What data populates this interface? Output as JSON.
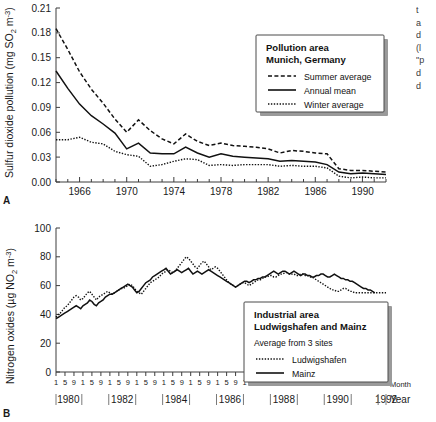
{
  "figure": {
    "panel_a_letter": "A",
    "panel_b_letter": "B"
  },
  "edge_text": {
    "lines": [
      "t",
      "a",
      "d",
      "(l",
      "\"p",
      "d",
      "d"
    ]
  },
  "panel_a": {
    "ylabel": "Sulfur dioxide pollution (mg SO",
    "ylabel_sub": "2",
    "ylabel_tail": " m",
    "ylabel_sup": "-3",
    "ylabel_close": ")",
    "yticks": [
      "0.00",
      "0.03",
      "0.06",
      "0.09",
      "0.12",
      "0.15",
      "0.18",
      "0.21"
    ],
    "xticks": [
      "1966",
      "1970",
      "1974",
      "1978",
      "1982",
      "1986",
      "1990"
    ],
    "legend": {
      "title_line1": "Pollution area",
      "title_line2": "Munich, Germany",
      "items": [
        {
          "label": "Summer average",
          "style": "dashed"
        },
        {
          "label": "Annual mean",
          "style": "solid"
        },
        {
          "label": "Winter average",
          "style": "dotted"
        }
      ]
    }
  },
  "panel_b": {
    "ylabel": "Nitrogen oxides (µg NO",
    "ylabel_sub": "2",
    "ylabel_tail": " m",
    "ylabel_sup": "-3",
    "ylabel_close": ")",
    "yticks": [
      "0",
      "20",
      "40",
      "60",
      "80",
      "100"
    ],
    "month_ticks": [
      "1",
      "5",
      "9"
    ],
    "month_axis_label": "Month",
    "year_axis_label": "Year",
    "year_labels": [
      "1980",
      "1982",
      "1984",
      "1986",
      "1988",
      "1990",
      "1992"
    ],
    "legend": {
      "title_line1": "Industrial area",
      "title_line2": "Ludwigshafen and Mainz",
      "subtitle": "Average from 3 sites",
      "items": [
        {
          "label": "Ludwigshafen",
          "style": "dotted"
        },
        {
          "label": "Mainz",
          "style": "solid"
        }
      ]
    }
  },
  "chart_data": [
    {
      "type": "line",
      "title": "Pollution area Munich, Germany",
      "xlabel": "",
      "ylabel": "Sulfur dioxide pollution (mg SO2 m-3)",
      "xlim": [
        1964,
        1992
      ],
      "ylim": [
        0.0,
        0.21
      ],
      "grid": false,
      "legend_position": "upper-right",
      "x": [
        1964,
        1965,
        1966,
        1967,
        1968,
        1969,
        1970,
        1971,
        1972,
        1973,
        1974,
        1975,
        1976,
        1977,
        1978,
        1979,
        1980,
        1981,
        1982,
        1983,
        1984,
        1985,
        1986,
        1987,
        1988,
        1989,
        1990,
        1991,
        1992
      ],
      "series": [
        {
          "name": "Summer average",
          "style": "dashed",
          "values": [
            0.185,
            0.16,
            0.133,
            0.112,
            0.095,
            0.076,
            0.06,
            0.075,
            0.062,
            0.052,
            0.046,
            0.058,
            0.049,
            0.044,
            0.047,
            0.044,
            0.043,
            0.042,
            0.04,
            0.035,
            0.038,
            0.037,
            0.035,
            0.034,
            0.016,
            0.014,
            0.014,
            0.013,
            0.012
          ]
        },
        {
          "name": "Annual mean",
          "style": "solid",
          "values": [
            0.134,
            0.113,
            0.094,
            0.08,
            0.07,
            0.059,
            0.04,
            0.047,
            0.035,
            0.034,
            0.034,
            0.042,
            0.035,
            0.03,
            0.034,
            0.031,
            0.03,
            0.029,
            0.028,
            0.025,
            0.026,
            0.025,
            0.024,
            0.021,
            0.012,
            0.01,
            0.011,
            0.01,
            0.009
          ]
        },
        {
          "name": "Winter average",
          "style": "dotted",
          "values": [
            0.051,
            0.051,
            0.054,
            0.048,
            0.046,
            0.037,
            0.033,
            0.031,
            0.019,
            0.021,
            0.025,
            0.028,
            0.027,
            0.02,
            0.021,
            0.02,
            0.021,
            0.021,
            0.021,
            0.019,
            0.02,
            0.019,
            0.019,
            0.017,
            0.007,
            0.005,
            0.006,
            0.005,
            0.005
          ]
        }
      ]
    },
    {
      "type": "line",
      "title": "Industrial area Ludwigshafen and Mainz",
      "subtitle": "Average from 3 sites",
      "xlabel": "Month / Year",
      "ylabel": "Nitrogen oxides (µg NO2 m-3)",
      "xlim": [
        1980.0,
        1992.9
      ],
      "ylim": [
        0,
        100
      ],
      "grid": false,
      "legend_position": "lower-right",
      "x_unit": "month",
      "x_start": "1980-01",
      "x_end": "1992-11",
      "series": [
        {
          "name": "Ludwigshafen",
          "style": "dotted",
          "values": [
            38,
            40,
            41,
            43,
            45,
            46,
            48,
            50,
            52,
            53,
            52,
            50,
            51,
            53,
            55,
            56,
            54,
            52,
            50,
            52,
            53,
            54,
            55,
            56,
            55,
            54,
            55,
            56,
            57,
            58,
            58,
            59,
            60,
            61,
            60,
            58,
            56,
            55,
            54,
            56,
            58,
            60,
            62,
            63,
            64,
            65,
            66,
            68,
            69,
            70,
            71,
            70,
            69,
            70,
            72,
            74,
            76,
            78,
            80,
            79,
            77,
            75,
            73,
            72,
            74,
            76,
            77,
            75,
            73,
            71,
            72,
            73,
            72,
            70,
            68,
            66,
            64,
            62,
            61,
            60,
            59,
            60,
            61,
            62,
            62,
            61,
            60,
            61,
            62,
            63,
            64,
            64,
            65,
            66,
            66,
            67,
            67,
            66,
            66,
            67,
            68,
            68,
            69,
            69,
            68,
            68,
            68,
            67,
            67,
            68,
            68,
            67,
            67,
            66,
            66,
            65,
            64,
            63,
            62,
            61,
            60,
            59,
            58,
            57,
            57,
            56,
            56,
            57,
            58,
            58,
            57,
            56,
            56,
            55,
            55,
            55,
            55,
            55,
            55,
            55,
            55,
            55,
            55,
            55,
            55,
            55,
            55,
            55
          ]
        },
        {
          "name": "Mainz",
          "style": "solid",
          "values": [
            37,
            38,
            39,
            40,
            41,
            42,
            43,
            44,
            45,
            46,
            45,
            44,
            46,
            47,
            48,
            50,
            49,
            47,
            46,
            48,
            49,
            50,
            52,
            53,
            54,
            54,
            55,
            56,
            57,
            58,
            59,
            60,
            61,
            60,
            59,
            57,
            55,
            56,
            58,
            60,
            62,
            63,
            64,
            66,
            67,
            68,
            69,
            70,
            71,
            72,
            70,
            68,
            69,
            70,
            71,
            70,
            69,
            70,
            71,
            72,
            70,
            68,
            69,
            70,
            69,
            68,
            69,
            70,
            71,
            70,
            69,
            68,
            67,
            66,
            65,
            64,
            63,
            62,
            61,
            60,
            59,
            60,
            61,
            62,
            63,
            63,
            62,
            63,
            64,
            64,
            65,
            65,
            66,
            66,
            67,
            68,
            69,
            70,
            69,
            68,
            69,
            70,
            70,
            69,
            68,
            69,
            70,
            69,
            68,
            67,
            68,
            68,
            67,
            67,
            66,
            66,
            67,
            67,
            68,
            68,
            67,
            66,
            66,
            67,
            68,
            67,
            66,
            65,
            65,
            64,
            64,
            63,
            63,
            62,
            61,
            60,
            59,
            58,
            58,
            57,
            57,
            56,
            55
          ]
        }
      ]
    }
  ]
}
